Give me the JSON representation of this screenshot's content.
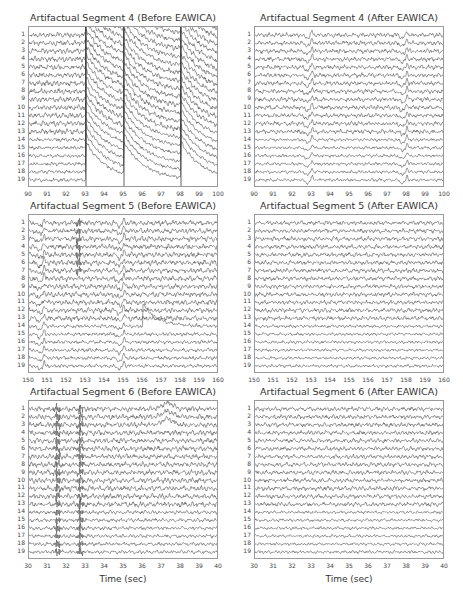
{
  "figure": {
    "xlabel": "Time (sec)",
    "channels": [
      "1",
      "2",
      "3",
      "4",
      "5",
      "6",
      "7",
      "8",
      "9",
      "10",
      "11",
      "12",
      "13",
      "14",
      "15",
      "16",
      "17",
      "18",
      "19"
    ],
    "trace_color": "#3a3a3a",
    "frame_color": "#9a9a9a"
  },
  "chart_data": [
    {
      "type": "line",
      "title": "Artifactual Segment 4 (Before EAWICA)",
      "xlabel": "",
      "ylabel": "",
      "xlim": [
        90,
        100
      ],
      "xticks": [
        "90",
        "91",
        "92",
        "93",
        "94",
        "95",
        "96",
        "97",
        "98",
        "99",
        "100"
      ],
      "series_count": 19,
      "series_labels": [
        "1",
        "2",
        "3",
        "4",
        "5",
        "6",
        "7",
        "8",
        "9",
        "10",
        "11",
        "12",
        "13",
        "14",
        "15",
        "16",
        "17",
        "18",
        "19"
      ],
      "artifacts": [
        {
          "kind": "step-decay",
          "t": 93.0,
          "channels": "all",
          "note": "large step up then exponential decay"
        },
        {
          "kind": "step-decay",
          "t": 95.0,
          "channels": "all"
        },
        {
          "kind": "step-decay",
          "t": 98.0,
          "channels": "all"
        }
      ],
      "grid": false
    },
    {
      "type": "line",
      "title": "Artifactual Segment 4 (After EAWICA)",
      "xlim": [
        90,
        100
      ],
      "xticks": [
        "90",
        "91",
        "92",
        "93",
        "94",
        "95",
        "96",
        "97",
        "98",
        "99",
        "100"
      ],
      "series_count": 19,
      "series_labels": [
        "1",
        "2",
        "3",
        "4",
        "5",
        "6",
        "7",
        "8",
        "9",
        "10",
        "11",
        "12",
        "13",
        "14",
        "15",
        "16",
        "17",
        "18",
        "19"
      ],
      "artifacts": [
        {
          "kind": "spike",
          "t": 93.0,
          "channels": "all",
          "note": "residual small transient"
        },
        {
          "kind": "spike",
          "t": 98.0,
          "channels": "all"
        }
      ],
      "grid": false
    },
    {
      "type": "line",
      "title": "Artifactual Segment 5 (Before EAWICA)",
      "xlim": [
        150,
        160
      ],
      "xticks": [
        "150",
        "151",
        "152",
        "153",
        "154",
        "155",
        "156",
        "157",
        "158",
        "159",
        "160"
      ],
      "series_count": 19,
      "series_labels": [
        "1",
        "2",
        "3",
        "4",
        "5",
        "6",
        "7",
        "8",
        "9",
        "10",
        "11",
        "12",
        "13",
        "14",
        "15",
        "16",
        "17",
        "18",
        "19"
      ],
      "artifacts": [
        {
          "kind": "burst",
          "t": 152.6,
          "channels": "1-7",
          "note": "high-frequency burst"
        },
        {
          "kind": "spike",
          "t": 150.8,
          "channels": "all"
        },
        {
          "kind": "spike",
          "t": 155.0,
          "channels": "all"
        },
        {
          "kind": "drift",
          "t": 156.0,
          "channels": "14",
          "note": "channel 14 jumps up then decays to ~158"
        }
      ],
      "grid": false
    },
    {
      "type": "line",
      "title": "Artifactual Segment 5 (After EAWICA)",
      "xlim": [
        150,
        160
      ],
      "xticks": [
        "150",
        "151",
        "152",
        "153",
        "154",
        "155",
        "156",
        "157",
        "158",
        "159",
        "160"
      ],
      "series_count": 19,
      "series_labels": [
        "1",
        "2",
        "3",
        "4",
        "5",
        "6",
        "7",
        "8",
        "9",
        "10",
        "11",
        "12",
        "13",
        "14",
        "15",
        "16",
        "17",
        "18",
        "19"
      ],
      "artifacts": [],
      "grid": false
    },
    {
      "type": "line",
      "title": "Artifactual Segment 6 (Before EAWICA)",
      "xlabel": "Time (sec)",
      "xlim": [
        30,
        40
      ],
      "xticks": [
        "30",
        "31",
        "32",
        "33",
        "34",
        "35",
        "36",
        "37",
        "38",
        "39",
        "40"
      ],
      "series_count": 19,
      "series_labels": [
        "1",
        "2",
        "3",
        "4",
        "5",
        "6",
        "7",
        "8",
        "9",
        "10",
        "11",
        "12",
        "13",
        "14",
        "15",
        "16",
        "17",
        "18",
        "19"
      ],
      "artifacts": [
        {
          "kind": "burst",
          "t": 31.5,
          "channels": "all"
        },
        {
          "kind": "burst",
          "t": 32.7,
          "channels": "all"
        },
        {
          "kind": "wave",
          "t": 37.3,
          "channels": "1-3",
          "note": "slow eye-blink like bump"
        }
      ],
      "grid": false
    },
    {
      "type": "line",
      "title": "Artifactual Segment 6 (After EAWICA)",
      "xlabel": "Time (sec)",
      "xlim": [
        30,
        40
      ],
      "xticks": [
        "30",
        "31",
        "32",
        "33",
        "34",
        "35",
        "36",
        "37",
        "38",
        "39",
        "40"
      ],
      "series_count": 19,
      "series_labels": [
        "1",
        "2",
        "3",
        "4",
        "5",
        "6",
        "7",
        "8",
        "9",
        "10",
        "11",
        "12",
        "13",
        "14",
        "15",
        "16",
        "17",
        "18",
        "19"
      ],
      "artifacts": [],
      "grid": false
    }
  ],
  "layout": {
    "panels": [
      {
        "x": 28,
        "y": 26,
        "w": 190,
        "h": 161
      },
      {
        "x": 254,
        "y": 26,
        "w": 190,
        "h": 161
      },
      {
        "x": 28,
        "y": 214,
        "w": 190,
        "h": 159
      },
      {
        "x": 254,
        "y": 214,
        "w": 190,
        "h": 159
      },
      {
        "x": 28,
        "y": 400,
        "w": 190,
        "h": 159
      },
      {
        "x": 254,
        "y": 400,
        "w": 190,
        "h": 159
      }
    ]
  }
}
